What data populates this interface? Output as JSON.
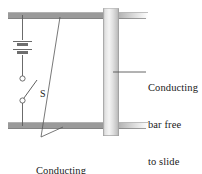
{
  "figure": {
    "background_color": "#ffffff"
  },
  "labels": {
    "bar_line1": "Conducting",
    "bar_line2": "bar free",
    "bar_line3": "to slide",
    "rails_line1": "Conducting",
    "rails_line2": "rails",
    "switch": "S"
  },
  "colors": {
    "rail_fill": "#9a9a9a",
    "rail_edge": "#6f6f6f",
    "bar_light": "#f2f2f2",
    "bar_mid": "#d6d6d6",
    "bar_dark": "#b4b4b4",
    "wire": "#4a4a4a",
    "text": "#1a1a1a",
    "leader": "#555555"
  },
  "components": {
    "top_rail": {
      "x": 8,
      "y": 12,
      "width": 140,
      "height": 7
    },
    "bottom_rail": {
      "x": 8,
      "y": 122,
      "width": 140,
      "height": 7
    },
    "sliding_bar": {
      "x": 103,
      "y": 8,
      "width": 16,
      "height": 128
    },
    "battery": {
      "x": 22,
      "y": 38,
      "plates": 2
    },
    "switch": {
      "x": 22,
      "top_terminal_y": 78,
      "bottom_terminal_y": 100
    }
  },
  "leaders": {
    "bar_leader": {
      "x1": 113,
      "y1": 72,
      "x2": 146,
      "y2": 72
    },
    "rail_leader_a": {
      "x1": 41,
      "y1": 137,
      "x2": 60,
      "y2": 17
    },
    "rail_leader_b": {
      "x1": 41,
      "y1": 137,
      "x2": 62,
      "y2": 127
    }
  }
}
